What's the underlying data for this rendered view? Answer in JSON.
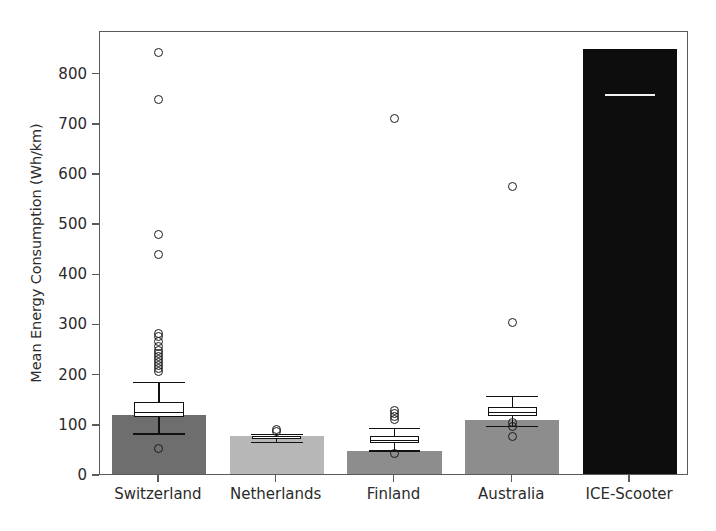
{
  "chart_data": {
    "type": "bar",
    "title": "",
    "xlabel": "",
    "ylabel": "Mean Energy Consumption (Wh/km)",
    "ylim": [
      0,
      885
    ],
    "yticks": [
      0,
      100,
      200,
      300,
      400,
      500,
      600,
      700,
      800
    ],
    "ytick_labels": [
      "0",
      "100",
      "200",
      "300",
      "400",
      "500",
      "600",
      "700",
      "800"
    ],
    "grid": false,
    "legend": null,
    "categories": [
      "Switzerland",
      "Netherlands",
      "Finland",
      "Australia",
      "ICE-Scooter"
    ],
    "values": [
      117,
      75,
      45,
      108,
      848
    ],
    "bar_colors": [
      "#6e6e6e",
      "#b7b7b7",
      "#8d8d8d",
      "#8d8d8d",
      "#0d0d0d"
    ],
    "overlay": "boxplot",
    "boxplots": [
      {
        "category": "Switzerland",
        "whisker_low": 85,
        "q1": 117,
        "median": 128,
        "q3": 148,
        "whisker_high": 188,
        "outliers": [
          845,
          750,
          482,
          442,
          285,
          278,
          268,
          258,
          250,
          244,
          238,
          232,
          226,
          220,
          214,
          208,
          55
        ]
      },
      {
        "category": "Netherlands",
        "whisker_low": 68,
        "q1": 73,
        "median": 76,
        "q3": 79,
        "whisker_high": 84,
        "outliers": [
          92,
          88
        ]
      },
      {
        "category": "Finland",
        "whisker_low": 52,
        "q1": 66,
        "median": 72,
        "q3": 80,
        "whisker_high": 96,
        "outliers": [
          712,
          130,
          124,
          118,
          112,
          44
        ]
      },
      {
        "category": "Australia",
        "whisker_low": 100,
        "q1": 120,
        "median": 128,
        "q3": 138,
        "whisker_high": 160,
        "outliers": [
          577,
          305,
          106,
          98,
          78
        ]
      },
      {
        "category": "ICE-Scooter",
        "whisker_low": null,
        "q1": null,
        "median": 762,
        "q3": null,
        "whisker_high": null,
        "outliers": []
      }
    ]
  },
  "axis": {
    "ylabel": "Mean Energy Consumption (Wh/km)",
    "tick_0": "0",
    "tick_100": "100",
    "tick_200": "200",
    "tick_300": "300",
    "tick_400": "400",
    "tick_500": "500",
    "tick_600": "600",
    "tick_700": "700",
    "tick_800": "800",
    "cat_0": "Switzerland",
    "cat_1": "Netherlands",
    "cat_2": "Finland",
    "cat_3": "Australia",
    "cat_4": "ICE-Scooter"
  },
  "colors": {
    "frame": "#5a5a5a",
    "text": "#2b2b2b",
    "box_edge": "#111111",
    "bar_switzerland": "#6e6e6e",
    "bar_netherlands": "#b7b7b7",
    "bar_finland": "#8d8d8d",
    "bar_australia": "#8d8d8d",
    "bar_ice": "#0d0d0d",
    "ice_median": "#f2f2f2"
  }
}
